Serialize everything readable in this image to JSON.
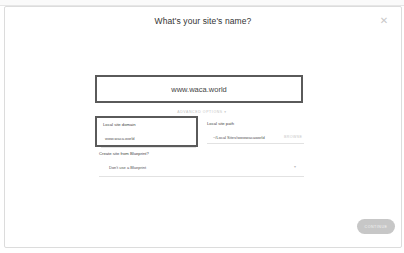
{
  "dialog": {
    "title": "What's your site's name?",
    "close_icon": "close-icon"
  },
  "site_name": {
    "value": "www.waca.world",
    "placeholder": "Site name"
  },
  "advanced_options": {
    "label": "ADVANCED OPTIONS ▾"
  },
  "local_domain": {
    "label": "Local site domain",
    "value": "www.waca.world"
  },
  "local_path": {
    "label": "Local site path",
    "value": "~/Local Sites/wwwwacaworld",
    "browse_label": "BROWSE"
  },
  "blueprint": {
    "label": "Create site from Blueprint?",
    "selected": "Don't use a Blueprint",
    "chevron_icon": "chevron-down-icon"
  },
  "footer": {
    "continue_label": "CONTINUE"
  },
  "colors": {
    "highlight_border": "#5a5a5a",
    "button_bg": "#c7c7c7",
    "muted_text": "#c4c4c4"
  }
}
